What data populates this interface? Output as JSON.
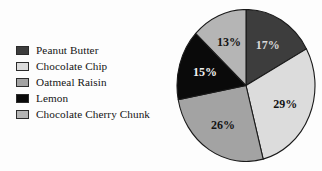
{
  "chart_data": {
    "type": "pie",
    "title": "",
    "subtitle": "",
    "xlabel": "",
    "ylabel": "",
    "legend_position": "left",
    "grid": false,
    "units": "%",
    "start_angle_deg": 0,
    "direction": "clockwise",
    "categories": [
      "Peanut Butter",
      "Chocolate Chip",
      "Oatmeal Raisin",
      "Lemon",
      "Chocolate Cherry Chunk"
    ],
    "values": [
      17,
      29,
      26,
      15,
      13
    ],
    "labels": [
      "17%",
      "29%",
      "26%",
      "15%",
      "13%"
    ],
    "colors": [
      "#3d3d3d",
      "#dcdcdc",
      "#a3a3a3",
      "#0a0a0a",
      "#b5b5b5"
    ],
    "label_text_colors": [
      "#d8d8d8",
      "#141414",
      "#141414",
      "#f2f2f2",
      "#141414"
    ],
    "slice_border_color": "#1a1a1a"
  },
  "legend": {
    "items": [
      {
        "label": "Peanut Butter",
        "color": "#3d3d3d"
      },
      {
        "label": "Chocolate Chip",
        "color": "#dcdcdc"
      },
      {
        "label": "Oatmeal Raisin",
        "color": "#a3a3a3"
      },
      {
        "label": "Lemon",
        "color": "#0a0a0a"
      },
      {
        "label": "Chocolate Cherry Chunk",
        "color": "#b5b5b5"
      }
    ]
  },
  "canvas": {
    "background": "#fdfdfd"
  }
}
